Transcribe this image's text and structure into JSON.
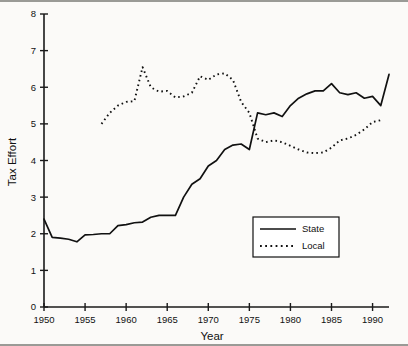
{
  "chart_data": {
    "type": "line",
    "title": "",
    "xlabel": "Year",
    "ylabel": "Tax Effort",
    "xlim": [
      1950,
      1992
    ],
    "ylim": [
      0,
      8
    ],
    "grid": false,
    "legend_position": "inside-lower-right",
    "x_ticks": [
      1950,
      1955,
      1960,
      1965,
      1970,
      1975,
      1980,
      1985,
      1990
    ],
    "x_tick_labels": [
      "1950",
      "1955",
      "1960",
      "1965",
      "1970",
      "1975",
      "1980",
      "1985",
      "1990"
    ],
    "y_ticks": [
      0,
      1,
      2,
      3,
      4,
      5,
      6,
      7,
      8
    ],
    "y_tick_labels": [
      "0",
      "1",
      "2",
      "3",
      "4",
      "5",
      "6",
      "7",
      "8"
    ],
    "series": [
      {
        "name": "State",
        "style": "solid",
        "color": "#111111",
        "x": [
          1950,
          1951,
          1952,
          1953,
          1954,
          1955,
          1956,
          1957,
          1958,
          1959,
          1960,
          1961,
          1962,
          1963,
          1964,
          1965,
          1966,
          1967,
          1968,
          1969,
          1970,
          1971,
          1972,
          1973,
          1974,
          1975,
          1976,
          1977,
          1978,
          1979,
          1980,
          1981,
          1982,
          1983,
          1984,
          1985,
          1986,
          1987,
          1988,
          1989,
          1990,
          1991,
          1992
        ],
        "values": [
          2.4,
          1.9,
          1.88,
          1.85,
          1.78,
          1.97,
          1.98,
          2.0,
          2.0,
          2.22,
          2.25,
          2.3,
          2.32,
          2.45,
          2.5,
          2.5,
          2.5,
          3.0,
          3.35,
          3.5,
          3.85,
          4.0,
          4.3,
          4.42,
          4.45,
          4.3,
          5.3,
          5.25,
          5.3,
          5.2,
          5.5,
          5.7,
          5.82,
          5.9,
          5.9,
          6.1,
          5.85,
          5.8,
          5.85,
          5.7,
          5.75,
          5.5,
          6.35
        ]
      },
      {
        "name": "Local",
        "style": "dotted",
        "color": "#111111",
        "x": [
          1957,
          1958,
          1959,
          1960,
          1961,
          1962,
          1963,
          1964,
          1965,
          1966,
          1967,
          1968,
          1969,
          1970,
          1971,
          1972,
          1973,
          1974,
          1975,
          1976,
          1977,
          1978,
          1979,
          1980,
          1981,
          1982,
          1983,
          1984,
          1985,
          1986,
          1987,
          1988,
          1989,
          1990,
          1991
        ],
        "values": [
          5.0,
          5.3,
          5.5,
          5.6,
          5.62,
          6.55,
          6.0,
          5.88,
          5.9,
          5.72,
          5.75,
          5.85,
          6.3,
          6.2,
          6.35,
          6.38,
          6.2,
          5.6,
          5.3,
          4.6,
          4.5,
          4.55,
          4.5,
          4.4,
          4.3,
          4.22,
          4.2,
          4.22,
          4.35,
          4.55,
          4.6,
          4.7,
          4.85,
          5.05,
          5.1
        ]
      }
    ]
  },
  "legend": {
    "entries": [
      {
        "label": "State",
        "style": "solid"
      },
      {
        "label": "Local",
        "style": "dotted"
      }
    ]
  }
}
